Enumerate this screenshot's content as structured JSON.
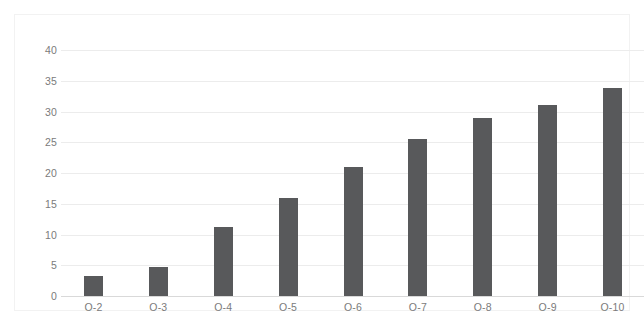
{
  "chart_data": {
    "type": "bar",
    "title": "",
    "subtitle": "",
    "xlabel": "",
    "ylabel": "",
    "categories": [
      "O-2",
      "O-3",
      "O-4",
      "O-5",
      "O-6",
      "O-7",
      "O-8",
      "O-9",
      "O-10"
    ],
    "values": [
      3.3,
      4.7,
      11.2,
      15.9,
      21.0,
      25.5,
      28.9,
      31.0,
      33.8
    ],
    "ylim": [
      0,
      40
    ],
    "ytick_labels": [
      "0",
      "5",
      "10",
      "15",
      "20",
      "25",
      "30",
      "35",
      "40"
    ],
    "ytick_values": [
      0,
      5,
      10,
      15,
      20,
      25,
      30,
      35,
      40
    ],
    "grid": true,
    "grid_axis": "y",
    "legend": false,
    "legend_position": "none",
    "bar_color": "#58595b",
    "gridline_color": "#ececec",
    "axis_color": "#d9d9d9",
    "tick_label_color": "#7b7b7b",
    "background_color": "#ffffff",
    "series": [
      {
        "name": "Series 1",
        "values": [
          3.3,
          4.7,
          11.2,
          15.9,
          21.0,
          25.5,
          28.9,
          31.0,
          33.8
        ]
      }
    ]
  }
}
